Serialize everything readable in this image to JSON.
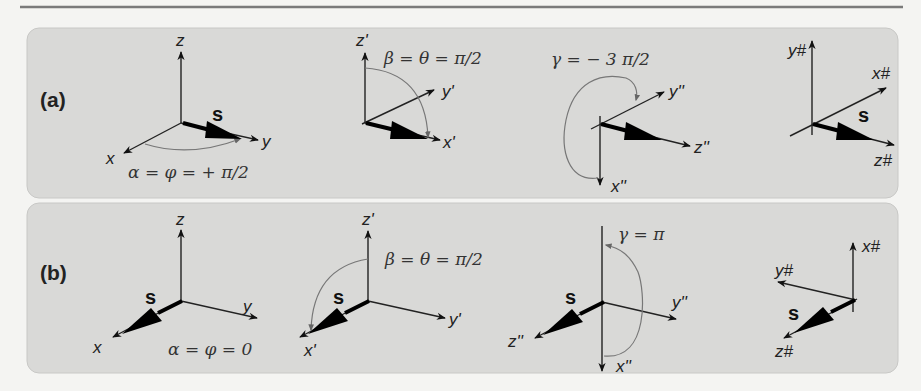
{
  "figure": {
    "panels": [
      {
        "id": "a",
        "label": "(a)",
        "steps": [
          {
            "axes": [
              "z",
              "x",
              "y"
            ],
            "vector": "s",
            "rotation": "α = φ = + π/2"
          },
          {
            "axes": [
              "z'",
              "y'",
              "x'"
            ],
            "rotation": "β = θ = π/2"
          },
          {
            "axes": [
              "y''",
              "z''",
              "x''"
            ],
            "rotation": "γ = − 3 π/2"
          },
          {
            "axes": [
              "y#",
              "x#",
              "z#"
            ],
            "vector": "s"
          }
        ]
      },
      {
        "id": "b",
        "label": "(b)",
        "steps": [
          {
            "axes": [
              "z",
              "y",
              "x"
            ],
            "vector": "s",
            "rotation": "α = φ = 0"
          },
          {
            "axes": [
              "z'",
              "y'",
              "x'"
            ],
            "vector": "s",
            "rotation": "β = θ = π/2"
          },
          {
            "axes": [
              "y''",
              "z''",
              "x''"
            ],
            "vector": "s",
            "rotation": "γ = π"
          },
          {
            "axes": [
              "x#",
              "y#",
              "z#"
            ],
            "vector": "s"
          }
        ]
      }
    ],
    "colors": {
      "panel_bg": "#d9d9d7",
      "page_bg": "#f4f4f2",
      "axis": "#222222",
      "arc": "#777777"
    }
  }
}
